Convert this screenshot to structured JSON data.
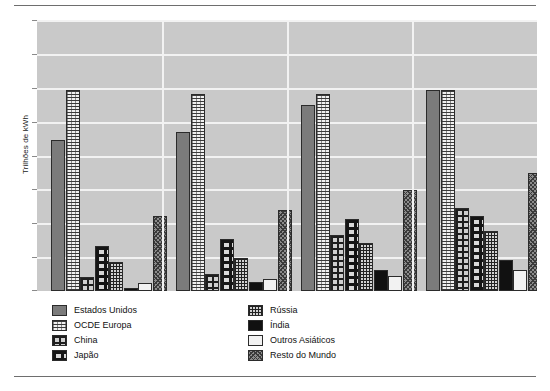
{
  "chart_data": {
    "type": "bar",
    "title": "",
    "subtitle": "",
    "xlabel": "",
    "ylabel": "Trilhões de kWh",
    "grid": true,
    "legend_position": "bottom",
    "ylim": [
      0,
      7
    ],
    "y_tick_count": 8,
    "y_tick_labels": [
      "",
      "",
      "",
      "",
      "",
      "",
      "",
      ""
    ],
    "categories": [
      "Grupo 1",
      "Grupo 2",
      "Grupo 3",
      "Grupo 4"
    ],
    "series": [
      {
        "name": "Estados Unidos",
        "pattern": "solid-gray",
        "values": [
          3.9,
          4.1,
          4.8,
          5.2
        ]
      },
      {
        "name": "OCDE Europa",
        "pattern": "h-grid",
        "values": [
          5.2,
          5.1,
          5.1,
          5.2
        ]
      },
      {
        "name": "China",
        "pattern": "brick",
        "values": [
          0.35,
          0.45,
          1.45,
          2.15
        ]
      },
      {
        "name": "Japão",
        "pattern": "japan-check",
        "values": [
          1.15,
          1.35,
          1.85,
          1.95
        ]
      },
      {
        "name": "Rússia",
        "pattern": "fine-grid",
        "values": [
          0.75,
          0.85,
          1.25,
          1.55
        ]
      },
      {
        "name": "Índia",
        "pattern": "black",
        "values": [
          0.08,
          0.22,
          0.55,
          0.8
        ]
      },
      {
        "name": "Outros Asiáticos",
        "pattern": "white",
        "values": [
          0.2,
          0.3,
          0.4,
          0.55
        ]
      },
      {
        "name": "Resto do Mundo",
        "pattern": "speckle",
        "values": [
          1.95,
          2.1,
          2.6,
          3.05
        ]
      }
    ]
  },
  "legend": {
    "column_left": [
      {
        "label": "Estados Unidos",
        "swatch": "solid-gray"
      },
      {
        "label": "OCDE Europa",
        "swatch": "h-grid"
      },
      {
        "label": "China",
        "swatch": "brick"
      },
      {
        "label": "Japão",
        "swatch": "japan-check"
      }
    ],
    "column_right": [
      {
        "label": "Rússia",
        "swatch": "fine-grid"
      },
      {
        "label": "Índia",
        "swatch": "black"
      },
      {
        "label": "Outros Asiáticos",
        "swatch": "white"
      },
      {
        "label": "Resto do Mundo",
        "swatch": "speckle"
      }
    ]
  },
  "axis": {
    "y_title": "Trilhões de kWh"
  },
  "colors": {
    "plot_background": "#c9c9c9",
    "gridline": "#f2f2f2",
    "bar_outline": "#2b2b2b",
    "page_background": "#ffffff",
    "rule": "#6e6e6e"
  }
}
